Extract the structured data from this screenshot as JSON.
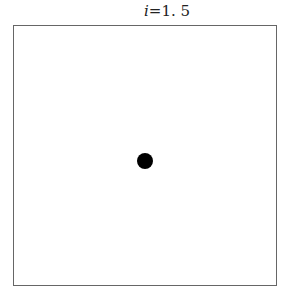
{
  "figure": {
    "title_var": "i",
    "title_eq": "=",
    "title_value": "1. 5",
    "dot": {
      "cx": 145,
      "cy": 161,
      "radius": 8,
      "color": "#000000"
    }
  }
}
